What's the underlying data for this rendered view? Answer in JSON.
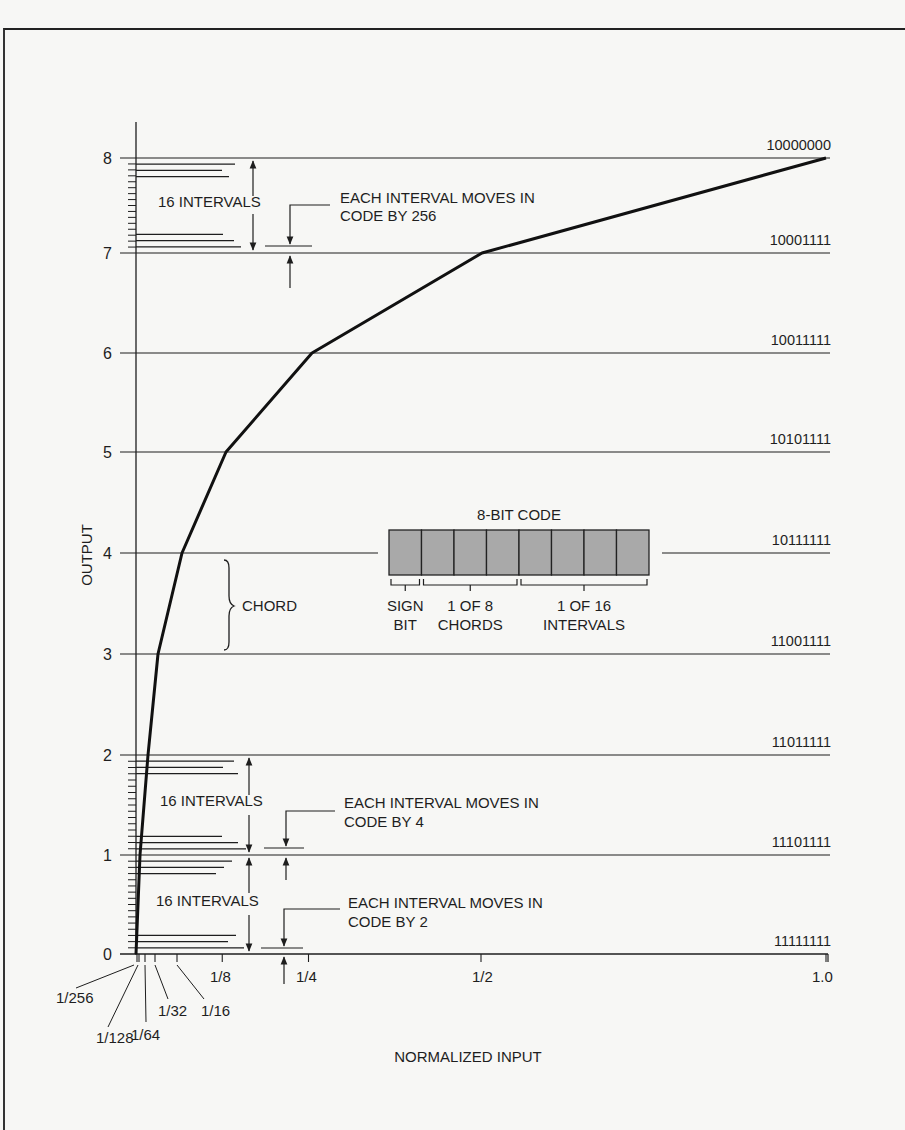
{
  "chart_data": {
    "type": "line",
    "title": "",
    "xlabel": "NORMALIZED INPUT",
    "ylabel": "OUTPUT",
    "x_ticks": [
      "1/256",
      "1/128",
      "1/64",
      "1/32",
      "1/16",
      "1/8",
      "1/4",
      "1/2",
      "1.0"
    ],
    "y_ticks": [
      "0",
      "1",
      "2",
      "3",
      "4",
      "5",
      "6",
      "7",
      "8"
    ],
    "xlim": [
      0,
      1.0
    ],
    "ylim": [
      0,
      8
    ],
    "series": [
      {
        "name": "Companding characteristic (segmented log)",
        "x": [
          0,
          0.0078125,
          0.015625,
          0.03125,
          0.0625,
          0.125,
          0.25,
          0.5,
          1.0
        ],
        "y": [
          0,
          1,
          2,
          3,
          4,
          5,
          6,
          7,
          8
        ]
      }
    ],
    "code_labels": [
      {
        "level": 8,
        "code": "10000000"
      },
      {
        "level": 7,
        "code": "10001111"
      },
      {
        "level": 6,
        "code": "10011111"
      },
      {
        "level": 5,
        "code": "10101111"
      },
      {
        "level": 4,
        "code": "10111111"
      },
      {
        "level": 3,
        "code": "11001111"
      },
      {
        "level": 2,
        "code": "11011111"
      },
      {
        "level": 1,
        "code": "11101111"
      },
      {
        "level": 0,
        "code": "11111111"
      }
    ],
    "annotations": [
      {
        "text": "16 INTERVALS",
        "between": [
          7,
          8
        ]
      },
      {
        "text": "EACH INTERVAL MOVES IN",
        "text2": "CODE BY 256",
        "at_level": 7
      },
      {
        "text": "CHORD",
        "between": [
          3,
          4
        ]
      },
      {
        "text": "16 INTERVALS",
        "between": [
          1,
          2
        ]
      },
      {
        "text": "EACH INTERVAL MOVES IN",
        "text2": "CODE BY 4",
        "at_level": 1
      },
      {
        "text": "16 INTERVALS",
        "between": [
          0,
          1
        ]
      },
      {
        "text": "EACH INTERVAL MOVES IN",
        "text2": "CODE BY 2",
        "at_level": 0
      }
    ],
    "inset": {
      "title": "8-BIT CODE",
      "bits": 8,
      "groups": [
        {
          "label1": "SIGN",
          "label2": "BIT",
          "bits": 1
        },
        {
          "label1": "1 OF 8",
          "label2": "CHORDS",
          "bits": 3
        },
        {
          "label1": "1 OF 16",
          "label2": "INTERVALS",
          "bits": 4
        }
      ]
    },
    "grid": false,
    "legend": "none"
  },
  "ui": {
    "ann_16_intervals": "16 INTERVALS",
    "ann_each_line1": "EACH INTERVAL MOVES IN",
    "ann_code_256": "CODE BY 256",
    "ann_code_4": "CODE BY 4",
    "ann_code_2": "CODE BY 2",
    "ann_chord": "CHORD",
    "colors": {
      "ink": "#1e1e1e",
      "paper": "#f7f7f5",
      "cell_fill": "#a9a9a9"
    }
  }
}
